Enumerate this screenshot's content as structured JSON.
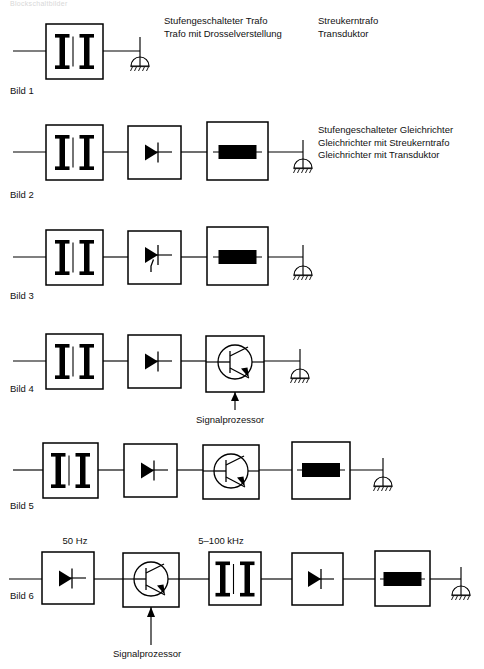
{
  "header": {
    "text": "Blockschaltbilder"
  },
  "rows": [
    {
      "label": "Bild 1",
      "blocks": [
        "transformer"
      ],
      "captions": [
        [
          "Stufengeschalteter Trafo",
          "Trafo mit Drosselverstellung"
        ],
        [
          "Streukerntrafo",
          "Transduktor"
        ]
      ]
    },
    {
      "label": "Bild 2",
      "blocks": [
        "transformer",
        "diode",
        "battery"
      ],
      "captions": [
        [
          "Stufengeschalteter Gleichrichter",
          "Gleichrichter mit Streukerntrafo",
          "Gleichrichter mit Transduktor"
        ]
      ]
    },
    {
      "label": "Bild 3",
      "blocks": [
        "transformer",
        "thyristor",
        "battery"
      ],
      "captions": []
    },
    {
      "label": "Bild 4",
      "blocks": [
        "transformer",
        "diode",
        "transistor"
      ],
      "captions": [],
      "signal_label": "Signalprozessor"
    },
    {
      "label": "Bild 5",
      "blocks": [
        "transformer",
        "diode",
        "transistor",
        "battery"
      ],
      "captions": []
    },
    {
      "label": "Bild 6",
      "blocks": [
        "diode",
        "transistor",
        "transformer",
        "diode",
        "battery"
      ],
      "captions": [],
      "signal_label": "Signalprozessor",
      "freq_labels": [
        "50 Hz",
        "5–100 kHz"
      ]
    }
  ],
  "colors": {
    "line": "#000000",
    "fill": "#000000",
    "background": "#ffffff"
  }
}
